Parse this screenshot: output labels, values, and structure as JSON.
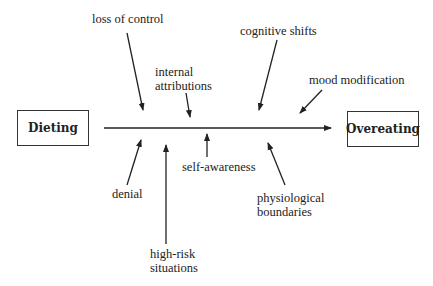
{
  "diagram": {
    "type": "fishbone",
    "cause_box": {
      "label": "Dieting"
    },
    "effect_box": {
      "label": "Overeating"
    },
    "factors_above": [
      {
        "label": "loss of control"
      },
      {
        "label_line1": "internal",
        "label_line2": "attributions"
      },
      {
        "label": "cognitive shifts"
      },
      {
        "label": "mood modification"
      }
    ],
    "factors_below": [
      {
        "label": "denial"
      },
      {
        "label_line1": "high-risk",
        "label_line2": "situations"
      },
      {
        "label": "self-awareness"
      },
      {
        "label_line1": "physiological",
        "label_line2": "boundaries"
      }
    ],
    "colors": {
      "line": "#222222",
      "text": "#222222",
      "background": "#ffffff"
    }
  }
}
